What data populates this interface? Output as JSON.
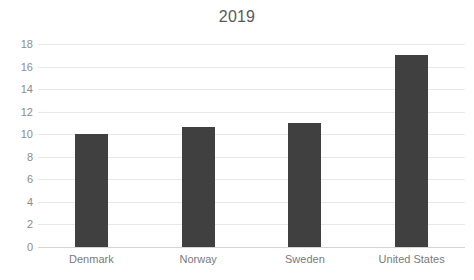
{
  "chart_data": {
    "type": "bar",
    "title": "2019",
    "xlabel": "",
    "ylabel": "",
    "categories": [
      "Denmark",
      "Norway",
      "Sweden",
      "United States"
    ],
    "values": [
      10.0,
      10.6,
      11.0,
      17.0
    ],
    "ylim": [
      0,
      18
    ],
    "ytick_labels": [
      "18",
      "16",
      "14",
      "12",
      "10",
      "8",
      "6",
      "4",
      "2",
      "0"
    ],
    "ytick_values": [
      18,
      16,
      14,
      12,
      10,
      8,
      6,
      4,
      2,
      0
    ],
    "grid": true,
    "legend": false,
    "bar_color": "#404040",
    "gridline_color": "#e8e8e8",
    "axis_color": "#d4d4d4",
    "title_color": "#595959",
    "tick_label_color": "#8c8c8c",
    "category_label_color": "#7a7a7a"
  }
}
